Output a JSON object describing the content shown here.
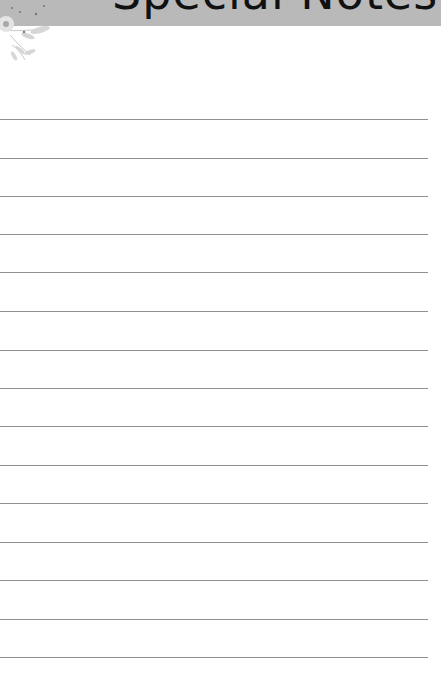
{
  "page": {
    "title": "Special Notes",
    "header_color": "#b9b9b9",
    "line_color": "#8f8f8f",
    "decoration": "floral-corner-icon"
  },
  "lines": [
    {
      "y": 119
    },
    {
      "y": 158
    },
    {
      "y": 196
    },
    {
      "y": 234
    },
    {
      "y": 272
    },
    {
      "y": 311
    },
    {
      "y": 350
    },
    {
      "y": 388
    },
    {
      "y": 426
    },
    {
      "y": 465
    },
    {
      "y": 503
    },
    {
      "y": 542
    },
    {
      "y": 580
    },
    {
      "y": 619
    },
    {
      "y": 657
    }
  ]
}
